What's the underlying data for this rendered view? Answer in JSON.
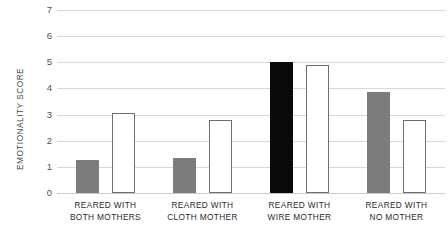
{
  "chart_data": {
    "type": "bar",
    "title": "",
    "xlabel": "",
    "ylabel": "EMOTIONALITY SCORE",
    "ylim": [
      0,
      7
    ],
    "yticks": [
      0,
      1,
      2,
      3,
      4,
      5,
      6,
      7
    ],
    "ytick_labels": [
      "0",
      "1",
      "2",
      "3",
      "4",
      "5",
      "6",
      "7"
    ],
    "grid": true,
    "legend": "none",
    "categories": [
      "REARED WITH BOTH MOTHERS",
      "REARED WITH CLOTH MOTHER",
      "REARED WITH WIRE MOTHER",
      "REARED WITH NO MOTHER"
    ],
    "category_lines": [
      [
        "REARED WITH",
        "BOTH MOTHERS"
      ],
      [
        "REARED WITH",
        "CLOTH MOTHER"
      ],
      [
        "REARED WITH",
        "WIRE MOTHER"
      ],
      [
        "REARED WITH",
        "NO MOTHER"
      ]
    ],
    "series": [
      {
        "name": "first-bar",
        "values": [
          1.25,
          1.35,
          5.0,
          3.85
        ],
        "styles": [
          "filled-gray",
          "filled-gray",
          "filled-black",
          "filled-gray"
        ]
      },
      {
        "name": "second-bar",
        "values": [
          3.05,
          2.8,
          4.9,
          2.8
        ],
        "styles": [
          "outline",
          "outline",
          "outline",
          "outline"
        ]
      }
    ],
    "colors": {
      "gray_bar": "#7c7c7c",
      "black_bar": "#0a0a0a",
      "outline_bar_fill": "#ffffff",
      "outline_bar_stroke": "#6e6e6e",
      "gridline": "#d8d8d8",
      "text": "#2b2b2b",
      "background": "#ffffff"
    }
  }
}
